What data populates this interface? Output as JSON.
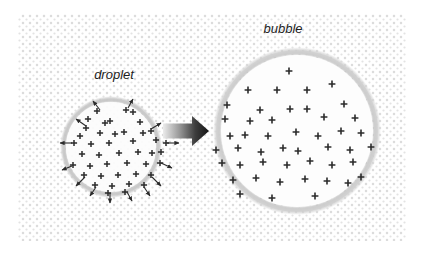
{
  "figure": {
    "canvas": {
      "width": 425,
      "height": 263,
      "background": "#ffffff"
    },
    "texture": {
      "name": "dotted-background",
      "x": 18,
      "y": 14,
      "width": 388,
      "height": 227,
      "dot_color": "#d9d9d9",
      "dot_spacing": 7,
      "dot_radius": 1.25
    }
  },
  "labels": {
    "droplet": "droplet",
    "bubble": "bubble"
  },
  "droplet": {
    "label": "droplet",
    "label_x": 114,
    "label_y": 79,
    "center_x": 111,
    "center_y": 147,
    "radius": 47,
    "ring_color": "#c9c9c9",
    "ring_width": 7,
    "fill_color": "#fcfcfc",
    "charge_symbol": "+",
    "charge_color": "#2b2b2b",
    "charge_count": 43,
    "arrow_count": 14,
    "arrow_color": "#2b2b2b",
    "charges": [
      [
        97,
        111
      ],
      [
        126,
        110
      ],
      [
        110,
        121
      ],
      [
        140,
        122
      ],
      [
        86,
        128
      ],
      [
        100,
        133
      ],
      [
        124,
        132
      ],
      [
        151,
        131
      ],
      [
        74,
        143
      ],
      [
        91,
        144
      ],
      [
        109,
        143
      ],
      [
        133,
        141
      ],
      [
        156,
        140
      ],
      [
        166,
        143
      ],
      [
        82,
        154
      ],
      [
        99,
        155
      ],
      [
        119,
        153
      ],
      [
        138,
        152
      ],
      [
        152,
        153
      ],
      [
        73,
        165
      ],
      [
        90,
        166
      ],
      [
        107,
        164
      ],
      [
        127,
        163
      ],
      [
        146,
        164
      ],
      [
        160,
        163
      ],
      [
        84,
        175
      ],
      [
        101,
        176
      ],
      [
        118,
        175
      ],
      [
        136,
        174
      ],
      [
        151,
        175
      ],
      [
        95,
        185
      ],
      [
        112,
        186
      ],
      [
        129,
        184
      ],
      [
        144,
        185
      ],
      [
        105,
        123
      ],
      [
        115,
        134
      ],
      [
        143,
        133
      ],
      [
        88,
        119
      ],
      [
        133,
        112
      ],
      [
        80,
        136
      ],
      [
        161,
        152
      ],
      [
        108,
        193
      ],
      [
        125,
        192
      ]
    ],
    "arrows": [
      {
        "x1": 100,
        "y1": 110,
        "x2": 93,
        "y2": 101
      },
      {
        "x1": 128,
        "y1": 108,
        "x2": 133,
        "y2": 99
      },
      {
        "x1": 86,
        "y1": 126,
        "x2": 76,
        "y2": 119
      },
      {
        "x1": 151,
        "y1": 129,
        "x2": 161,
        "y2": 123
      },
      {
        "x1": 72,
        "y1": 143,
        "x2": 60,
        "y2": 143
      },
      {
        "x1": 167,
        "y1": 143,
        "x2": 179,
        "y2": 143
      },
      {
        "x1": 72,
        "y1": 166,
        "x2": 62,
        "y2": 170
      },
      {
        "x1": 161,
        "y1": 163,
        "x2": 172,
        "y2": 168
      },
      {
        "x1": 85,
        "y1": 177,
        "x2": 76,
        "y2": 186
      },
      {
        "x1": 152,
        "y1": 177,
        "x2": 161,
        "y2": 186
      },
      {
        "x1": 96,
        "y1": 187,
        "x2": 90,
        "y2": 196
      },
      {
        "x1": 144,
        "y1": 187,
        "x2": 150,
        "y2": 196
      },
      {
        "x1": 110,
        "y1": 193,
        "x2": 110,
        "y2": 203
      },
      {
        "x1": 127,
        "y1": 192,
        "x2": 132,
        "y2": 201
      }
    ]
  },
  "bubble": {
    "label": "bubble",
    "label_x": 283,
    "label_y": 33,
    "center_x": 297,
    "center_y": 131,
    "radius": 79,
    "ring_color": "#cfcfcf",
    "ring_width": 8,
    "fill_color": "#fdfdfd",
    "charge_symbol": "+",
    "charge_color": "#2b2b2b",
    "charge_count": 43,
    "charges": [
      [
        289,
        71
      ],
      [
        332,
        84
      ],
      [
        248,
        90
      ],
      [
        277,
        90
      ],
      [
        307,
        90
      ],
      [
        227,
        105
      ],
      [
        260,
        110
      ],
      [
        290,
        109
      ],
      [
        307,
        109
      ],
      [
        344,
        104
      ],
      [
        225,
        119
      ],
      [
        250,
        121
      ],
      [
        272,
        120
      ],
      [
        324,
        117
      ],
      [
        355,
        118
      ],
      [
        230,
        136
      ],
      [
        245,
        135
      ],
      [
        268,
        136
      ],
      [
        296,
        132
      ],
      [
        318,
        136
      ],
      [
        341,
        131
      ],
      [
        361,
        133
      ],
      [
        216,
        150
      ],
      [
        238,
        148
      ],
      [
        261,
        152
      ],
      [
        283,
        148
      ],
      [
        298,
        151
      ],
      [
        328,
        147
      ],
      [
        350,
        150
      ],
      [
        371,
        147
      ],
      [
        222,
        163
      ],
      [
        240,
        165
      ],
      [
        263,
        162
      ],
      [
        287,
        165
      ],
      [
        310,
        161
      ],
      [
        332,
        165
      ],
      [
        353,
        162
      ],
      [
        233,
        180
      ],
      [
        256,
        178
      ],
      [
        280,
        182
      ],
      [
        305,
        179
      ],
      [
        327,
        181
      ],
      [
        348,
        183
      ],
      [
        272,
        198
      ],
      [
        315,
        196
      ],
      [
        240,
        194
      ],
      [
        361,
        177
      ]
    ]
  },
  "transform_arrow": {
    "name": "transformation-arrow",
    "direction": "right",
    "x": 163,
    "y": 131,
    "length": 46,
    "gradient_from": "#e8e8e8",
    "gradient_to": "#1a1a1a"
  }
}
